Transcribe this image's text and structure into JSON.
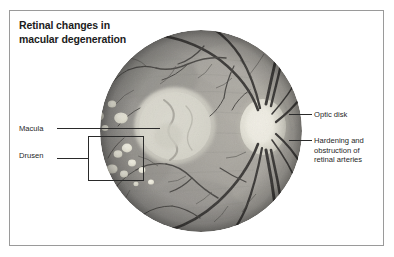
{
  "figure": {
    "title_lines": [
      "Retinal changes in",
      "macular degeneration"
    ],
    "title_full": "Retinal changes in macular degeneration",
    "frame_color": "#9a9a9a",
    "background": "#ffffff",
    "text_color": "#1f1f1f"
  },
  "image": {
    "name": "retinal-fundus-photograph",
    "description": "Grayscale fundus photograph of the retina",
    "shape": "circle",
    "base_color": "#9b9b9b",
    "vessel_color": "#3a3a3a"
  },
  "labels": {
    "macula": "Macula",
    "drusen": "Drusen",
    "optic_disk": "Optic disk",
    "hardening": "Hardening and obstruction of retinal arteries"
  },
  "features": {
    "macula": {
      "name": "macula",
      "label": "Macula",
      "fill": "#d8d6cf",
      "note": "Pale circular region left of centre"
    },
    "optic_disk": {
      "name": "optic-disk",
      "label": "Optic disk",
      "fill": "#e5e3da",
      "note": "Bright oval where vessels and nerve exit"
    },
    "drusen": {
      "name": "drusen",
      "label": "Drusen",
      "fill": "#ececdf",
      "count": 11,
      "note": "Small pale yellow-white deposits around the macula"
    },
    "retinal_arteries": {
      "name": "retinal-arteries",
      "label": "Hardening and obstruction of retinal arteries",
      "note": "Thick dark vessels emerging from the optic disk"
    }
  }
}
